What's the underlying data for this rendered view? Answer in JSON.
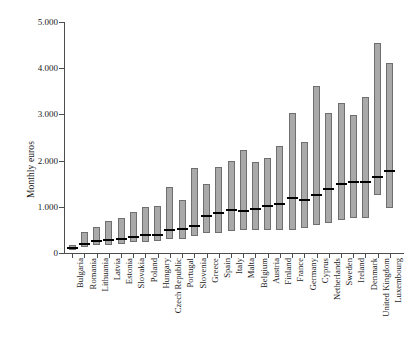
{
  "chart_data": {
    "type": "bar",
    "subtype": "range-bar-with-median",
    "title": "",
    "xlabel": "",
    "ylabel": "Monthly euros",
    "ylim": [
      0,
      5000
    ],
    "ytick_values": [
      0,
      1000,
      2000,
      3000,
      4000,
      5000
    ],
    "ytick_labels": [
      "0",
      "1.000",
      "2.000",
      "3.000",
      "4.000",
      "5.000"
    ],
    "grid": false,
    "legend": null,
    "value_format": "European thousands separator (period)",
    "categories": [
      "Bulgaria",
      "Romania",
      "Lithuania",
      "Latvia",
      "Estonia",
      "Slovakia",
      "Poland",
      "Hungary",
      "Czech Republic",
      "Portugal",
      "Slovenia",
      "Greece",
      "Spain",
      "Italy",
      "Malta",
      "Belgium",
      "Austria",
      "Finland",
      "France",
      "Germany",
      "Cyprus",
      "Netherlands",
      "Sweden",
      "Ireland",
      "Denmark",
      "United Kingdom",
      "Luxembourg"
    ],
    "series": [
      {
        "name": "range_low",
        "values": [
          70,
          120,
          170,
          180,
          200,
          230,
          240,
          250,
          300,
          310,
          370,
          440,
          430,
          470,
          490,
          500,
          500,
          500,
          500,
          550,
          600,
          640,
          720,
          760,
          760,
          1255,
          974
        ]
      },
      {
        "name": "range_high",
        "values": [
          180,
          460,
          560,
          700,
          760,
          880,
          1000,
          1020,
          1420,
          1150,
          1830,
          1500,
          1870,
          2000,
          2240,
          1980,
          2050,
          2310,
          3040,
          2400,
          3620,
          3030,
          3240,
          2980,
          3380,
          4545,
          4112
        ]
      },
      {
        "name": "median",
        "values": [
          100,
          200,
          260,
          280,
          300,
          340,
          400,
          400,
          490,
          520,
          580,
          800,
          860,
          930,
          900,
          960,
          1020,
          1060,
          1190,
          1140,
          1250,
          1390,
          1490,
          1540,
          1540,
          1645,
          1775
        ]
      }
    ]
  },
  "axis": {
    "y_label": "Monthly euros"
  }
}
